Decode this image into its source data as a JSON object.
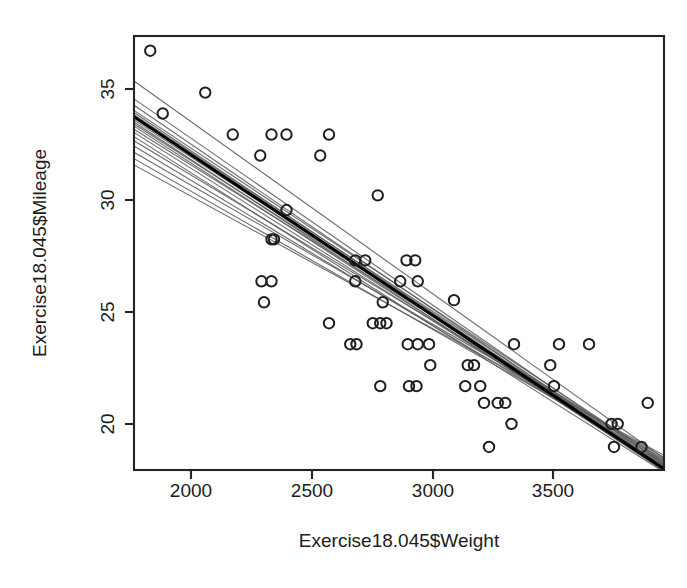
{
  "chart_data": {
    "type": "scatter",
    "title": "",
    "subtitle": "",
    "xlabel": "Exercise18.045$Weight",
    "ylabel": "Exercise18.045$Mileage",
    "xlim": [
      1780,
      3900
    ],
    "ylim": [
      17.0,
      37.7
    ],
    "xticks": [
      2000,
      2500,
      3000,
      3500
    ],
    "xtick_labels": [
      "2000",
      "2500",
      "3000",
      "3500"
    ],
    "yticks": [
      20,
      25,
      30,
      35
    ],
    "ytick_labels": [
      "20",
      "25",
      "30",
      "35"
    ],
    "grid": false,
    "legend": null,
    "point_marker": "open-circle",
    "point_count": 74,
    "points": [
      {
        "x": 1845,
        "y": 37.0
      },
      {
        "x": 2065,
        "y": 35.0
      },
      {
        "x": 1895,
        "y": 34.0
      },
      {
        "x": 2175,
        "y": 33.0
      },
      {
        "x": 2330,
        "y": 33.0
      },
      {
        "x": 2390,
        "y": 33.0
      },
      {
        "x": 2560,
        "y": 33.0
      },
      {
        "x": 2285,
        "y": 32.0
      },
      {
        "x": 2525,
        "y": 32.0
      },
      {
        "x": 2755,
        "y": 30.1
      },
      {
        "x": 2390,
        "y": 29.4
      },
      {
        "x": 2330,
        "y": 28.0
      },
      {
        "x": 2340,
        "y": 28.0
      },
      {
        "x": 2665,
        "y": 27.0
      },
      {
        "x": 2705,
        "y": 27.0
      },
      {
        "x": 2870,
        "y": 27.0
      },
      {
        "x": 2905,
        "y": 27.0
      },
      {
        "x": 2290,
        "y": 26.0
      },
      {
        "x": 2330,
        "y": 26.0
      },
      {
        "x": 2665,
        "y": 26.0
      },
      {
        "x": 2845,
        "y": 26.0
      },
      {
        "x": 2915,
        "y": 26.0
      },
      {
        "x": 2300,
        "y": 25.0
      },
      {
        "x": 2775,
        "y": 25.0
      },
      {
        "x": 3060,
        "y": 25.1
      },
      {
        "x": 2560,
        "y": 24.0
      },
      {
        "x": 2735,
        "y": 24.0
      },
      {
        "x": 2765,
        "y": 24.0
      },
      {
        "x": 2790,
        "y": 24.0
      },
      {
        "x": 2645,
        "y": 23.0
      },
      {
        "x": 2670,
        "y": 23.0
      },
      {
        "x": 2875,
        "y": 23.0
      },
      {
        "x": 2915,
        "y": 23.0
      },
      {
        "x": 2960,
        "y": 23.0
      },
      {
        "x": 3300,
        "y": 23.0
      },
      {
        "x": 3480,
        "y": 23.0
      },
      {
        "x": 3600,
        "y": 23.0
      },
      {
        "x": 2965,
        "y": 22.0
      },
      {
        "x": 3115,
        "y": 22.0
      },
      {
        "x": 3140,
        "y": 22.0
      },
      {
        "x": 3445,
        "y": 22.0
      },
      {
        "x": 2765,
        "y": 21.0
      },
      {
        "x": 2880,
        "y": 21.0
      },
      {
        "x": 2910,
        "y": 21.0
      },
      {
        "x": 3105,
        "y": 21.0
      },
      {
        "x": 3165,
        "y": 21.0
      },
      {
        "x": 3460,
        "y": 21.0
      },
      {
        "x": 3180,
        "y": 20.2
      },
      {
        "x": 3235,
        "y": 20.2
      },
      {
        "x": 3265,
        "y": 20.2
      },
      {
        "x": 3835,
        "y": 20.2
      },
      {
        "x": 3290,
        "y": 19.2
      },
      {
        "x": 3690,
        "y": 19.2
      },
      {
        "x": 3715,
        "y": 19.2
      },
      {
        "x": 3200,
        "y": 18.1
      },
      {
        "x": 3700,
        "y": 18.1
      },
      {
        "x": 3810,
        "y": 18.1
      }
    ],
    "fit_line": {
      "name": "least-squares-fit",
      "color": "#000000",
      "x0": 1780,
      "y0": 33.85,
      "x1": 3900,
      "y1": 17.05
    },
    "bootstrap_lines": {
      "name": "bootstrap-resample-fits",
      "color": "#5d5d5d",
      "count": 19,
      "lines": [
        {
          "x0": 1780,
          "y0": 35.55,
          "x1": 3900,
          "y1": 17.55
        },
        {
          "x0": 1780,
          "y0": 34.7,
          "x1": 3900,
          "y1": 17.25
        },
        {
          "x0": 1780,
          "y0": 34.4,
          "x1": 3900,
          "y1": 17.15
        },
        {
          "x0": 1780,
          "y0": 34.15,
          "x1": 3900,
          "y1": 17.4
        },
        {
          "x0": 1780,
          "y0": 34.05,
          "x1": 3900,
          "y1": 17.1
        },
        {
          "x0": 1780,
          "y0": 33.95,
          "x1": 3900,
          "y1": 17.3
        },
        {
          "x0": 1780,
          "y0": 33.8,
          "x1": 3900,
          "y1": 17.0
        },
        {
          "x0": 1780,
          "y0": 33.7,
          "x1": 3900,
          "y1": 17.2
        },
        {
          "x0": 1780,
          "y0": 33.6,
          "x1": 3900,
          "y1": 16.95
        },
        {
          "x0": 1780,
          "y0": 33.5,
          "x1": 3900,
          "y1": 17.35
        },
        {
          "x0": 1780,
          "y0": 33.4,
          "x1": 3900,
          "y1": 17.05
        },
        {
          "x0": 1780,
          "y0": 33.25,
          "x1": 3900,
          "y1": 17.45
        },
        {
          "x0": 1780,
          "y0": 33.1,
          "x1": 3900,
          "y1": 17.15
        },
        {
          "x0": 1780,
          "y0": 32.9,
          "x1": 3900,
          "y1": 16.9
        },
        {
          "x0": 1780,
          "y0": 32.7,
          "x1": 3900,
          "y1": 17.5
        },
        {
          "x0": 1780,
          "y0": 32.45,
          "x1": 3900,
          "y1": 17.25
        },
        {
          "x0": 1780,
          "y0": 32.15,
          "x1": 3900,
          "y1": 17.6
        },
        {
          "x0": 1780,
          "y0": 31.85,
          "x1": 3900,
          "y1": 17.4
        },
        {
          "x0": 1780,
          "y0": 31.55,
          "x1": 3900,
          "y1": 17.7
        }
      ]
    },
    "geometry": {
      "plot_left": 134,
      "plot_right": 664,
      "plot_top": 36,
      "plot_bottom": 470,
      "xtick_px": [
        191,
        312,
        433,
        553
      ],
      "ytick_px": [
        424,
        312,
        200,
        89
      ],
      "point_radius_px": 5.2,
      "xtick_label_y": 497,
      "ytick_label_x": 107,
      "xaxis_title_xy": [
        399,
        547
      ],
      "yaxis_title_xy": [
        46,
        253
      ]
    }
  }
}
